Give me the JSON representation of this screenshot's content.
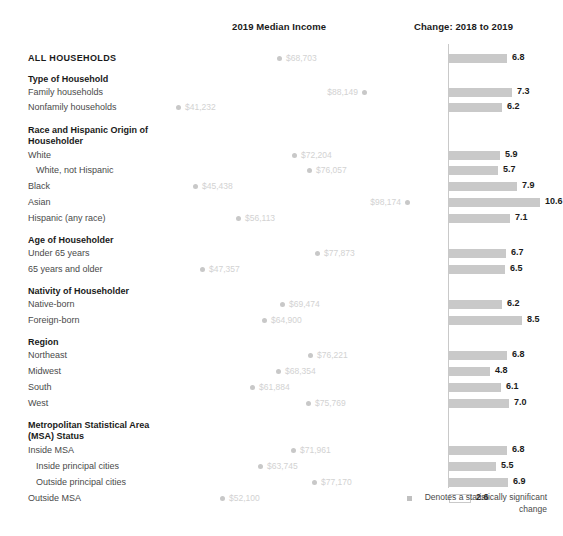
{
  "header": {
    "income_title": "2019 Median Income",
    "change_title": "Change: 2018 to 2019"
  },
  "legend": {
    "text": "Denotes a statistically significant change",
    "swatch_name": "significance-swatch"
  },
  "colors": {
    "bar_fill": "#c9c9c9",
    "dot_fill": "#c8c8c8",
    "dot_label": "#d2d2d2",
    "axis": "#c9c9c9",
    "label": "#4a4a4a",
    "heading": "#1a1a1a"
  },
  "chart_data": {
    "type": "bar",
    "title": "",
    "subtitle": "",
    "xlabel": "",
    "ylabel": "",
    "grid": false,
    "legend_position": "bottom-right",
    "panels": [
      {
        "name": "2019 Median Income",
        "type": "scatter",
        "value_prefix": "$",
        "xmin": 41232,
        "xmax": 98174,
        "px_min": 176,
        "px_max": 405
      },
      {
        "name": "Change: 2018 to 2019",
        "type": "bar",
        "unit": "percent",
        "xmin": 0,
        "xmax": 10.6,
        "px_per_unit": 8.6
      }
    ],
    "categories": [
      "ALL HOUSEHOLDS",
      "Family households",
      "Nonfamily households",
      "White",
      "White, not Hispanic",
      "Black",
      "Asian",
      "Hispanic (any race)",
      "Under 65 years",
      "65 years and older",
      "Native-born",
      "Foreign-born",
      "Northeast",
      "Midwest",
      "South",
      "West",
      "Inside MSA",
      "Inside principal cities",
      "Outside principal cities",
      "Outside MSA"
    ],
    "median_income": [
      68703,
      88149,
      41232,
      72204,
      76057,
      45438,
      98174,
      56113,
      77873,
      47357,
      69474,
      64900,
      76221,
      68354,
      61884,
      75769,
      71961,
      63745,
      77170,
      52100
    ],
    "percent_change": [
      6.8,
      7.3,
      6.2,
      5.9,
      5.7,
      7.9,
      10.6,
      7.1,
      6.7,
      6.5,
      6.2,
      8.5,
      6.8,
      4.8,
      6.1,
      7.0,
      6.8,
      5.5,
      6.9,
      2.6
    ],
    "significant": [
      true,
      true,
      true,
      true,
      true,
      true,
      true,
      true,
      true,
      true,
      true,
      true,
      true,
      true,
      true,
      true,
      true,
      true,
      true,
      false
    ]
  },
  "rows": [
    {
      "label": "ALL HOUSEHOLDS",
      "style": "allcaps",
      "top": 52,
      "income": "$68,703",
      "income_x": 277,
      "side": "right",
      "change": "6.8",
      "bar_w": 58,
      "significant": true
    },
    {
      "label": "Type of Household",
      "style": "group",
      "top": 73,
      "income": null,
      "change": null
    },
    {
      "label": "Family households",
      "style": "item",
      "top": 86,
      "income": "$88,149",
      "income_x": 362,
      "side": "left",
      "change": "7.3",
      "bar_w": 63,
      "significant": true
    },
    {
      "label": "Nonfamily households",
      "style": "item",
      "top": 101,
      "income": "$41,232",
      "income_x": 176,
      "side": "right",
      "change": "6.2",
      "bar_w": 53,
      "significant": true
    },
    {
      "label": "Race and Hispanic Origin of",
      "style": "group",
      "top": 124,
      "income": null,
      "change": null
    },
    {
      "label": "Householder",
      "style": "group",
      "top": 135,
      "income": null,
      "change": null
    },
    {
      "label": "White",
      "style": "item",
      "top": 149,
      "income": "$72,204",
      "income_x": 292,
      "side": "right",
      "change": "5.9",
      "bar_w": 51,
      "significant": true
    },
    {
      "label": "White, not Hispanic",
      "style": "item-indent",
      "top": 164,
      "income": "$76,057",
      "income_x": 307,
      "side": "right",
      "change": "5.7",
      "bar_w": 49,
      "significant": true
    },
    {
      "label": "Black",
      "style": "item",
      "top": 180,
      "income": "$45,438",
      "income_x": 193,
      "side": "right",
      "change": "7.9",
      "bar_w": 68,
      "significant": true
    },
    {
      "label": "Asian",
      "style": "item",
      "top": 196,
      "income": "$98,174",
      "income_x": 405,
      "side": "left",
      "change": "10.6",
      "bar_w": 91,
      "significant": true
    },
    {
      "label": "Hispanic (any race)",
      "style": "item",
      "top": 212,
      "income": "$56,113",
      "income_x": 236,
      "side": "right",
      "change": "7.1",
      "bar_w": 61,
      "significant": true
    },
    {
      "label": "Age of Householder",
      "style": "group",
      "top": 234,
      "income": null,
      "change": null
    },
    {
      "label": "Under 65 years",
      "style": "item",
      "top": 247,
      "income": "$77,873",
      "income_x": 315,
      "side": "right",
      "change": "6.7",
      "bar_w": 57,
      "significant": true
    },
    {
      "label": "65 years and older",
      "style": "item",
      "top": 263,
      "income": "$47,357",
      "income_x": 200,
      "side": "right",
      "change": "6.5",
      "bar_w": 56,
      "significant": true
    },
    {
      "label": "Nativity of Householder",
      "style": "group",
      "top": 285,
      "income": null,
      "change": null
    },
    {
      "label": "Native-born",
      "style": "item",
      "top": 298,
      "income": "$69,474",
      "income_x": 280,
      "side": "right",
      "change": "6.2",
      "bar_w": 53,
      "significant": true
    },
    {
      "label": "Foreign-born",
      "style": "item",
      "top": 314,
      "income": "$64,900",
      "income_x": 262,
      "side": "right",
      "change": "8.5",
      "bar_w": 73,
      "significant": true
    },
    {
      "label": "Region",
      "style": "group",
      "top": 336,
      "income": null,
      "change": null
    },
    {
      "label": "Northeast",
      "style": "item",
      "top": 349,
      "income": "$76,221",
      "income_x": 308,
      "side": "right",
      "change": "6.8",
      "bar_w": 58,
      "significant": true
    },
    {
      "label": "Midwest",
      "style": "item",
      "top": 365,
      "income": "$68,354",
      "income_x": 276,
      "side": "right",
      "change": "4.8",
      "bar_w": 41,
      "significant": true
    },
    {
      "label": "South",
      "style": "item",
      "top": 381,
      "income": "$61,884",
      "income_x": 250,
      "side": "right",
      "change": "6.1",
      "bar_w": 52,
      "significant": true
    },
    {
      "label": "West",
      "style": "item",
      "top": 397,
      "income": "$75,769",
      "income_x": 306,
      "side": "right",
      "change": "7.0",
      "bar_w": 60,
      "significant": true
    },
    {
      "label": "Metropolitan Statistical Area",
      "style": "group",
      "top": 419,
      "income": null,
      "change": null
    },
    {
      "label": "(MSA) Status",
      "style": "group",
      "top": 430,
      "income": null,
      "change": null
    },
    {
      "label": "Inside MSA",
      "style": "item",
      "top": 444,
      "income": "$71,961",
      "income_x": 291,
      "side": "right",
      "change": "6.8",
      "bar_w": 58,
      "significant": true
    },
    {
      "label": "Inside principal cities",
      "style": "item-indent",
      "top": 460,
      "income": "$63,745",
      "income_x": 258,
      "side": "right",
      "change": "5.5",
      "bar_w": 47,
      "significant": true
    },
    {
      "label": "Outside principal cities",
      "style": "item-indent",
      "top": 476,
      "income": "$77,170",
      "income_x": 312,
      "side": "right",
      "change": "6.9",
      "bar_w": 59,
      "significant": true
    },
    {
      "label": "Outside MSA",
      "style": "item",
      "top": 492,
      "income": "$52,100",
      "income_x": 220,
      "side": "right",
      "change": "2.6",
      "bar_w": 22,
      "significant": false
    }
  ]
}
